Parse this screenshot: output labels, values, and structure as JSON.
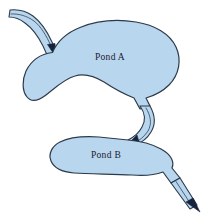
{
  "diagram": {
    "labels": {
      "pond_a": "Pond A",
      "pond_b": "Pond B"
    },
    "colors": {
      "water_fill": "#b9d6ef",
      "outline": "#2b3a4a",
      "arrow": "#16233a",
      "background": "#ffffff"
    },
    "features": [
      {
        "name": "inlet-stream",
        "label": "",
        "flow_direction": "into Pond A",
        "arrow": "down-right"
      },
      {
        "name": "pond-a",
        "label": "Pond A"
      },
      {
        "name": "connecting-channel",
        "label": "",
        "flow_direction": "Pond A to Pond B",
        "arrow": "down-left"
      },
      {
        "name": "pond-b",
        "label": "Pond B"
      },
      {
        "name": "outlet-stream",
        "label": "",
        "flow_direction": "out of Pond B",
        "arrow": "down-right"
      }
    ]
  }
}
